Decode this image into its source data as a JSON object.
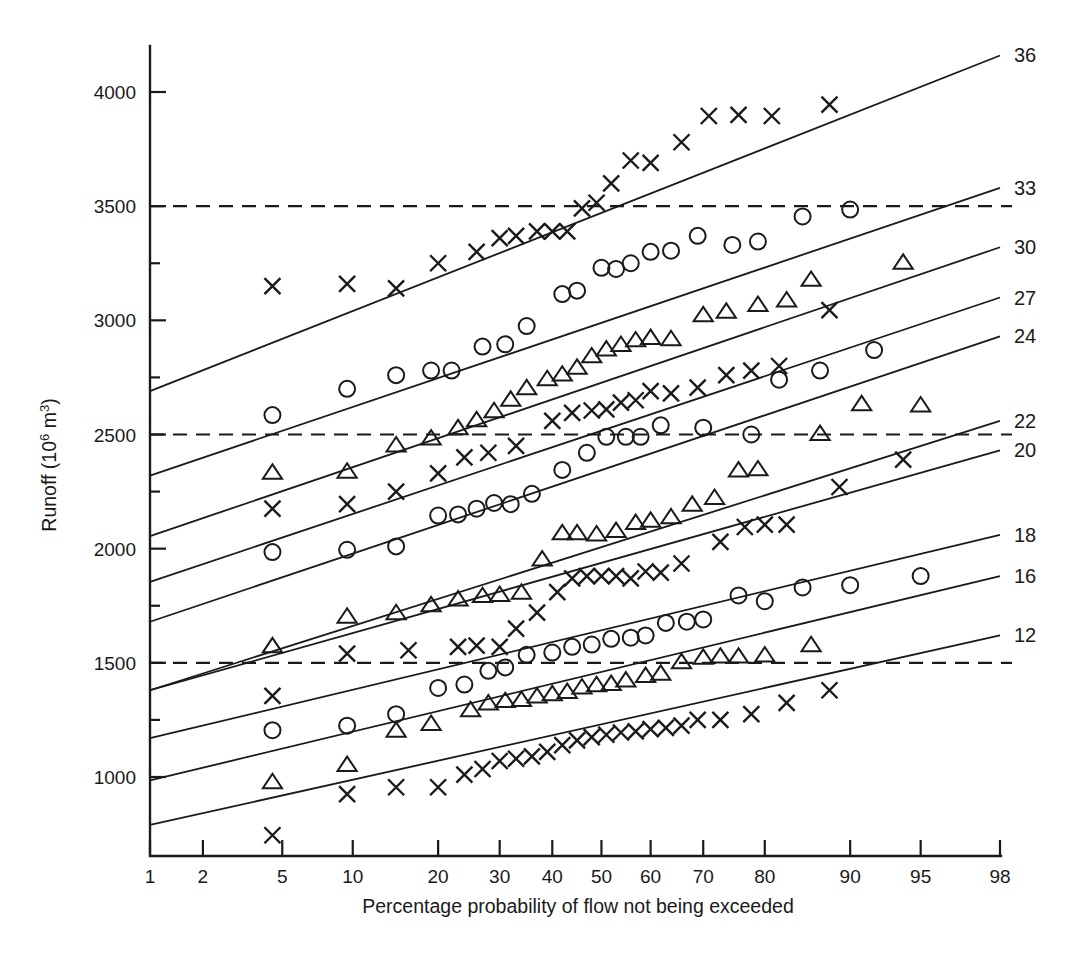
{
  "chart_data": {
    "type": "scatter",
    "title": "",
    "xlabel": "Percentage probability of flow not being exceeded",
    "ylabel": "Runoff (10⁶ m³)",
    "x_scale": "normal-probability",
    "x_ticks": [
      1,
      2,
      5,
      10,
      20,
      30,
      40,
      50,
      60,
      70,
      80,
      90,
      95,
      98
    ],
    "x_tick_labels": [
      "1",
      "2",
      "5",
      "10",
      "20",
      "30",
      "40",
      "50",
      "60",
      "70",
      "80",
      "90",
      "95",
      "98"
    ],
    "xlim": [
      1,
      98
    ],
    "y_ticks": [
      1000,
      1500,
      2000,
      2500,
      3000,
      3500,
      4000
    ],
    "y_tick_labels": [
      "1000",
      "1500",
      "2000",
      "2500",
      "3000",
      "3500",
      "4000"
    ],
    "y_minor_ticks": [
      1250,
      1750,
      2250,
      2750,
      3250
    ],
    "ylim": [
      700,
      4250
    ],
    "grid": false,
    "legend": "right-edge-line-labels",
    "reference_lines": [
      {
        "y": 1500,
        "style": "dashed"
      },
      {
        "y": 2500,
        "style": "dashed"
      },
      {
        "y": 3500,
        "style": "dashed"
      }
    ],
    "series": [
      {
        "name": "36",
        "label": "36",
        "marker": "cross",
        "fit_line": {
          "y_at_p1": 2690,
          "y_at_p98": 4160
        },
        "points": [
          [
            4.5,
            3150
          ],
          [
            9.5,
            3160
          ],
          [
            14.5,
            3140
          ],
          [
            20,
            3250
          ],
          [
            26,
            3300
          ],
          [
            30,
            3360
          ],
          [
            33,
            3370
          ],
          [
            37,
            3390
          ],
          [
            40,
            3390
          ],
          [
            43,
            3390
          ],
          [
            46,
            3490
          ],
          [
            49,
            3515
          ],
          [
            52,
            3600
          ],
          [
            56,
            3700
          ],
          [
            60,
            3690
          ],
          [
            66,
            3780
          ],
          [
            71,
            3895
          ],
          [
            76,
            3900
          ],
          [
            81,
            3895
          ],
          [
            88,
            3945
          ]
        ]
      },
      {
        "name": "33",
        "label": "33",
        "marker": "circle",
        "fit_line": {
          "y_at_p1": 2320,
          "y_at_p98": 3580
        },
        "points": [
          [
            4.5,
            2585
          ],
          [
            9.5,
            2700
          ],
          [
            14.5,
            2760
          ],
          [
            19,
            2780
          ],
          [
            22,
            2780
          ],
          [
            27,
            2885
          ],
          [
            31,
            2895
          ],
          [
            35,
            2975
          ],
          [
            42,
            3115
          ],
          [
            45,
            3130
          ],
          [
            50,
            3230
          ],
          [
            53,
            3225
          ],
          [
            56,
            3250
          ],
          [
            60,
            3300
          ],
          [
            64,
            3305
          ],
          [
            69,
            3370
          ],
          [
            75,
            3330
          ],
          [
            79,
            3345
          ],
          [
            85,
            3455
          ],
          [
            90,
            3485
          ]
        ]
      },
      {
        "name": "30",
        "label": "30",
        "marker": "triangle",
        "fit_line": {
          "y_at_p1": 2055,
          "y_at_p98": 3320
        },
        "points": [
          [
            4.5,
            2330
          ],
          [
            9.5,
            2335
          ],
          [
            14.5,
            2450
          ],
          [
            19,
            2480
          ],
          [
            23,
            2525
          ],
          [
            26,
            2560
          ],
          [
            29,
            2600
          ],
          [
            32,
            2650
          ],
          [
            35,
            2700
          ],
          [
            39,
            2740
          ],
          [
            42,
            2760
          ],
          [
            45,
            2790
          ],
          [
            48,
            2840
          ],
          [
            51,
            2870
          ],
          [
            54,
            2890
          ],
          [
            57,
            2910
          ],
          [
            60,
            2920
          ],
          [
            64,
            2915
          ],
          [
            70,
            3020
          ],
          [
            74,
            3035
          ],
          [
            79,
            3065
          ],
          [
            83,
            3085
          ],
          [
            86,
            3175
          ],
          [
            94,
            3250
          ]
        ]
      },
      {
        "name": "27",
        "label": "27",
        "marker": "cross",
        "fit_line": {
          "y_at_p1": 1855,
          "y_at_p98": 3100
        },
        "points": [
          [
            4.5,
            2175
          ],
          [
            9.5,
            2195
          ],
          [
            14.5,
            2250
          ],
          [
            20,
            2330
          ],
          [
            24,
            2400
          ],
          [
            28,
            2420
          ],
          [
            33,
            2450
          ],
          [
            40,
            2560
          ],
          [
            44,
            2595
          ],
          [
            48,
            2605
          ],
          [
            51,
            2610
          ],
          [
            54,
            2640
          ],
          [
            57,
            2650
          ],
          [
            60,
            2690
          ],
          [
            64,
            2680
          ],
          [
            69,
            2705
          ],
          [
            74,
            2760
          ],
          [
            78,
            2780
          ],
          [
            82,
            2800
          ],
          [
            88,
            3045
          ]
        ]
      },
      {
        "name": "24",
        "label": "24",
        "marker": "circle",
        "fit_line": {
          "y_at_p1": 1680,
          "y_at_p98": 2930
        },
        "points": [
          [
            4.5,
            1985
          ],
          [
            9.5,
            1995
          ],
          [
            14.5,
            2010
          ],
          [
            20,
            2145
          ],
          [
            23,
            2150
          ],
          [
            26,
            2175
          ],
          [
            29,
            2200
          ],
          [
            32,
            2195
          ],
          [
            36,
            2240
          ],
          [
            42,
            2345
          ],
          [
            47,
            2420
          ],
          [
            51,
            2490
          ],
          [
            55,
            2490
          ],
          [
            58,
            2490
          ],
          [
            62,
            2540
          ],
          [
            70,
            2530
          ],
          [
            78,
            2500
          ],
          [
            82,
            2740
          ],
          [
            87,
            2780
          ],
          [
            92,
            2870
          ]
        ]
      },
      {
        "name": "22",
        "label": "22",
        "marker": "triangle",
        "fit_line": {
          "y_at_p1": 1380,
          "y_at_p98": 2560
        },
        "points": [
          [
            4.5,
            1570
          ],
          [
            9.5,
            1700
          ],
          [
            14.5,
            1715
          ],
          [
            19,
            1750
          ],
          [
            23,
            1775
          ],
          [
            27,
            1790
          ],
          [
            30,
            1795
          ],
          [
            34,
            1805
          ],
          [
            38,
            1950
          ],
          [
            42,
            2065
          ],
          [
            45,
            2065
          ],
          [
            49,
            2060
          ],
          [
            53,
            2075
          ],
          [
            57,
            2110
          ],
          [
            60,
            2120
          ],
          [
            64,
            2135
          ],
          [
            68,
            2190
          ],
          [
            72,
            2220
          ],
          [
            76,
            2340
          ],
          [
            79,
            2345
          ],
          [
            87,
            2500
          ],
          [
            91,
            2630
          ],
          [
            95,
            2625
          ]
        ]
      },
      {
        "name": "20",
        "label": "20",
        "marker": "cross",
        "fit_line": {
          "y_at_p1": 1380,
          "y_at_p98": 2430
        },
        "points": [
          [
            4.5,
            1355
          ],
          [
            9.5,
            1540
          ],
          [
            16,
            1555
          ],
          [
            23,
            1570
          ],
          [
            26,
            1575
          ],
          [
            30,
            1570
          ],
          [
            33,
            1650
          ],
          [
            37,
            1720
          ],
          [
            41,
            1810
          ],
          [
            44,
            1870
          ],
          [
            47,
            1880
          ],
          [
            50,
            1880
          ],
          [
            53,
            1880
          ],
          [
            56,
            1870
          ],
          [
            59,
            1900
          ],
          [
            62,
            1895
          ],
          [
            66,
            1935
          ],
          [
            73,
            2030
          ],
          [
            77,
            2095
          ],
          [
            80,
            2105
          ],
          [
            83,
            2105
          ],
          [
            89,
            2270
          ],
          [
            94,
            2390
          ]
        ]
      },
      {
        "name": "18",
        "label": "18",
        "marker": "circle",
        "fit_line": {
          "y_at_p1": 1170,
          "y_at_p98": 2060
        },
        "points": [
          [
            4.5,
            1205
          ],
          [
            9.5,
            1225
          ],
          [
            14.5,
            1275
          ],
          [
            20,
            1390
          ],
          [
            24,
            1405
          ],
          [
            28,
            1465
          ],
          [
            31,
            1480
          ],
          [
            35,
            1535
          ],
          [
            40,
            1545
          ],
          [
            44,
            1570
          ],
          [
            48,
            1580
          ],
          [
            52,
            1605
          ],
          [
            56,
            1610
          ],
          [
            59,
            1620
          ],
          [
            63,
            1675
          ],
          [
            67,
            1680
          ],
          [
            70,
            1690
          ],
          [
            76,
            1795
          ],
          [
            80,
            1770
          ],
          [
            85,
            1830
          ],
          [
            90,
            1840
          ],
          [
            95,
            1880
          ]
        ]
      },
      {
        "name": "16",
        "label": "16",
        "marker": "triangle",
        "fit_line": {
          "y_at_p1": 985,
          "y_at_p98": 1880
        },
        "points": [
          [
            4.5,
            975
          ],
          [
            9.5,
            1050
          ],
          [
            14.5,
            1200
          ],
          [
            19,
            1230
          ],
          [
            25,
            1290
          ],
          [
            28,
            1320
          ],
          [
            31,
            1330
          ],
          [
            34,
            1335
          ],
          [
            37,
            1350
          ],
          [
            40,
            1360
          ],
          [
            43,
            1370
          ],
          [
            46,
            1390
          ],
          [
            49,
            1400
          ],
          [
            52,
            1405
          ],
          [
            55,
            1420
          ],
          [
            59,
            1440
          ],
          [
            62,
            1450
          ],
          [
            66,
            1500
          ],
          [
            70,
            1520
          ],
          [
            73,
            1525
          ],
          [
            76,
            1525
          ],
          [
            80,
            1530
          ],
          [
            86,
            1575
          ]
        ]
      },
      {
        "name": "12",
        "label": "12",
        "marker": "cross",
        "fit_line": {
          "y_at_p1": 790,
          "y_at_p98": 1620
        },
        "points": [
          [
            4.5,
            745
          ],
          [
            9.5,
            925
          ],
          [
            14.5,
            955
          ],
          [
            20,
            955
          ],
          [
            24,
            1010
          ],
          [
            27,
            1035
          ],
          [
            30,
            1070
          ],
          [
            33,
            1080
          ],
          [
            36,
            1090
          ],
          [
            39,
            1110
          ],
          [
            42,
            1140
          ],
          [
            45,
            1160
          ],
          [
            48,
            1175
          ],
          [
            51,
            1185
          ],
          [
            54,
            1195
          ],
          [
            57,
            1200
          ],
          [
            60,
            1210
          ],
          [
            63,
            1215
          ],
          [
            66,
            1225
          ],
          [
            69,
            1250
          ],
          [
            73,
            1250
          ],
          [
            78,
            1275
          ],
          [
            83,
            1325
          ],
          [
            88,
            1380
          ]
        ]
      }
    ]
  }
}
